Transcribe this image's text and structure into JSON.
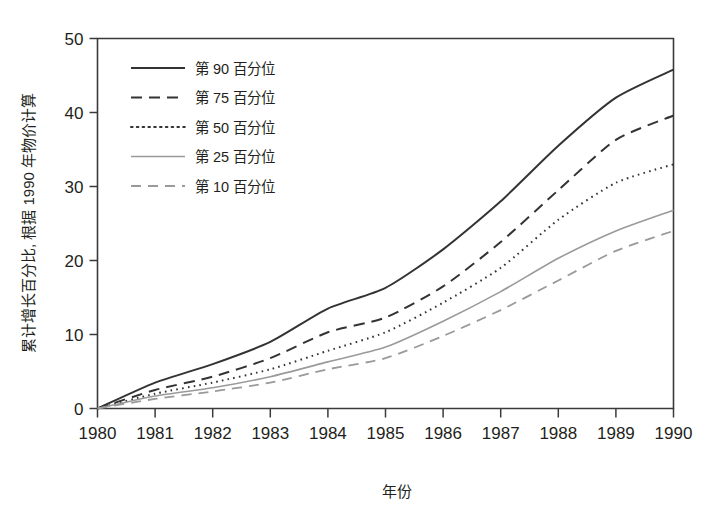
{
  "chart_data": {
    "type": "line",
    "title": "",
    "xlabel": "年份",
    "ylabel": "累计增长百分比, 根据 1990 年物价计算",
    "x": [
      1980,
      1981,
      1982,
      1983,
      1984,
      1985,
      1986,
      1987,
      1988,
      1989,
      1990
    ],
    "xtick_labels": [
      "1980",
      "1981",
      "1982",
      "1983",
      "1984",
      "1985",
      "1986",
      "1987",
      "1988",
      "1989",
      "1990"
    ],
    "ytick_labels": [
      "0",
      "10",
      "20",
      "30",
      "40",
      "50"
    ],
    "yticks": [
      0,
      10,
      20,
      30,
      40,
      50
    ],
    "xlim": [
      1980,
      1990
    ],
    "ylim": [
      0,
      50
    ],
    "grid": false,
    "legend_position": "upper-left",
    "series": [
      {
        "name": "第 90 百分位",
        "style": "solid",
        "color": "#333333",
        "width": 2.0,
        "values": [
          0,
          3.5,
          6.0,
          9.0,
          13.5,
          16.3,
          21.5,
          28.0,
          35.5,
          42.0,
          45.8
        ]
      },
      {
        "name": "第 75 百分位",
        "style": "dashed",
        "color": "#333333",
        "width": 2.0,
        "values": [
          0,
          2.5,
          4.3,
          6.8,
          10.3,
          12.3,
          16.5,
          22.5,
          29.5,
          36.3,
          39.6
        ]
      },
      {
        "name": "第 50 百分位",
        "style": "dotted",
        "color": "#333333",
        "width": 2.0,
        "values": [
          0,
          2.0,
          3.5,
          5.3,
          7.8,
          10.3,
          14.3,
          19.0,
          25.5,
          30.5,
          33.0
        ]
      },
      {
        "name": "第 25 百分位",
        "style": "solid",
        "color": "#9a9a9a",
        "width": 1.6,
        "values": [
          0,
          1.7,
          2.8,
          4.3,
          6.3,
          8.3,
          11.8,
          15.8,
          20.3,
          24.0,
          26.8
        ]
      },
      {
        "name": "第 10 百分位",
        "style": "dashed",
        "color": "#9a9a9a",
        "width": 1.8,
        "values": [
          0,
          1.3,
          2.3,
          3.5,
          5.3,
          6.8,
          9.8,
          13.3,
          17.3,
          21.3,
          24.0
        ]
      }
    ]
  }
}
